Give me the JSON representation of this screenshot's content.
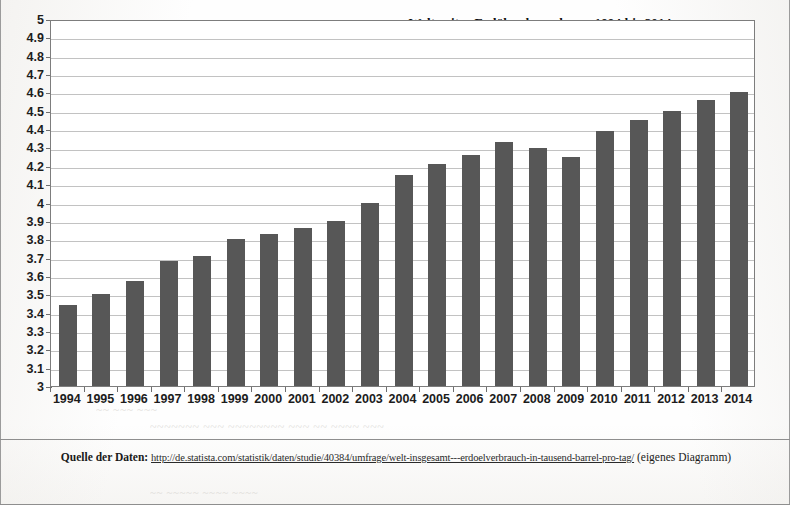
{
  "document": {
    "page_background": "#ffffff",
    "border_color": "#8e8e8e"
  },
  "chart_title_line1": "Weltweiter Erdölverbrauch von 1994 bis 2014",
  "chart_title_line2": "(in Mrd. Tonnen pro Jahr)",
  "source": {
    "lead": "Quelle der Daten:",
    "url": "http://de.statista.com/statistik/daten/studie/40384/umfrage/welt-insgesamt---erdoelverbrauch-in-tausend-barrel-pro-tag/",
    "suffix": "(eigenes Diagramm)"
  },
  "ghost_text": {
    "line1": "~~ ~~~ ~~~",
    "line2": "~~~~~~~ ~~~ ~~~~~~~~ ~~~ ~~ ~~~~ ~~~",
    "line3": "~~ ~~~~~ ~~~~ ~~~~",
    "line4": "~~~~~~ ~~~~",
    "line5": "~~~~ ~~ ~~~"
  },
  "chart_data": {
    "type": "bar",
    "title": "Weltweiter Erdölverbrauch von 1994 bis 2014 (in Mrd. Tonnen pro Jahr)",
    "xlabel": "",
    "ylabel": "",
    "ylim": [
      3,
      5
    ],
    "ytick_step": 0.1,
    "grid": true,
    "legend": false,
    "bar_color": "#575757",
    "categories": [
      "1994",
      "1995",
      "1996",
      "1997",
      "1998",
      "1999",
      "2000",
      "2001",
      "2002",
      "2003",
      "2004",
      "2005",
      "2006",
      "2007",
      "2008",
      "2009",
      "2010",
      "2011",
      "2012",
      "2013",
      "2014"
    ],
    "values": [
      3.44,
      3.5,
      3.57,
      3.68,
      3.71,
      3.8,
      3.83,
      3.86,
      3.9,
      4.0,
      4.15,
      4.21,
      4.26,
      4.33,
      4.3,
      4.25,
      4.39,
      4.45,
      4.5,
      4.56,
      4.6
    ],
    "ytick_labels": [
      "3",
      "3.1",
      "3.2",
      "3.3",
      "3.4",
      "3.5",
      "3.6",
      "3.7",
      "3.8",
      "3.9",
      "4",
      "4.1",
      "4.2",
      "4.3",
      "4.4",
      "4.5",
      "4.6",
      "4.7",
      "4.8",
      "4.9",
      "5"
    ]
  }
}
